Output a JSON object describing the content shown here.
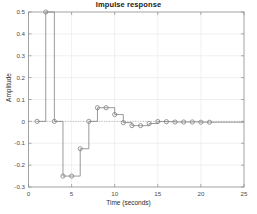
{
  "chart_data": {
    "type": "line",
    "title": "Impulse response",
    "xlabel": "Time (seconds)",
    "ylabel": "Amplitude",
    "xlim": [
      0,
      25
    ],
    "ylim": [
      -0.3,
      0.5
    ],
    "xticks": [
      0,
      5,
      10,
      15,
      20,
      25
    ],
    "xtick_labels": [
      "0",
      "5",
      "10",
      "15",
      "20",
      "25"
    ],
    "yticks": [
      -0.3,
      -0.2,
      -0.1,
      0,
      0.1,
      0.2,
      0.3,
      0.4,
      0.5
    ],
    "ytick_labels": [
      "-0.3",
      "-0.2",
      "-0.1",
      "0",
      "0.1",
      "0.2",
      "0.3",
      "0.4",
      "0.5"
    ],
    "grid": true,
    "legend": null,
    "style": "stairs-with-circle-markers",
    "line_color": "#808080",
    "marker_color": "#808080",
    "marker": "circle-open",
    "zero_line": true,
    "x": [
      1,
      2,
      3,
      4,
      5,
      6,
      7,
      8,
      9,
      10,
      11,
      12,
      13,
      14,
      15,
      16,
      17,
      18,
      19,
      20,
      21
    ],
    "values": [
      0,
      0.5,
      0,
      -0.25,
      -0.25,
      -0.125,
      0,
      0.0625,
      0.0625,
      0.03125,
      -0.0055,
      -0.0195,
      -0.0195,
      -0.0098,
      -0.0008,
      -0.0014,
      -0.0029,
      -0.0029,
      -0.0025,
      -0.0039,
      -0.0039
    ],
    "series": [
      {
        "name": "Impulse response",
        "points": [
          {
            "t": 1,
            "y": 0
          },
          {
            "t": 2,
            "y": 0.5
          },
          {
            "t": 3,
            "y": 0
          },
          {
            "t": 4,
            "y": -0.25
          },
          {
            "t": 5,
            "y": -0.25
          },
          {
            "t": 6,
            "y": -0.125
          },
          {
            "t": 7,
            "y": 0
          },
          {
            "t": 8,
            "y": 0.0625
          },
          {
            "t": 9,
            "y": 0.0625
          },
          {
            "t": 10,
            "y": 0.03125
          },
          {
            "t": 11,
            "y": -0.0055
          },
          {
            "t": 12,
            "y": -0.0195
          },
          {
            "t": 13,
            "y": -0.0195
          },
          {
            "t": 14,
            "y": -0.0098
          },
          {
            "t": 15,
            "y": -0.0008
          },
          {
            "t": 16,
            "y": -0.0014
          },
          {
            "t": 17,
            "y": -0.0029
          },
          {
            "t": 18,
            "y": -0.0029
          },
          {
            "t": 19,
            "y": -0.0025
          },
          {
            "t": 20,
            "y": -0.0039
          },
          {
            "t": 21,
            "y": -0.0039
          }
        ]
      }
    ]
  },
  "figure": {
    "background": "#ffffff",
    "axes_color": "#8c8c8c",
    "grid_color": "#e6e6e6",
    "tick_label_color": "#4d4d4d"
  }
}
